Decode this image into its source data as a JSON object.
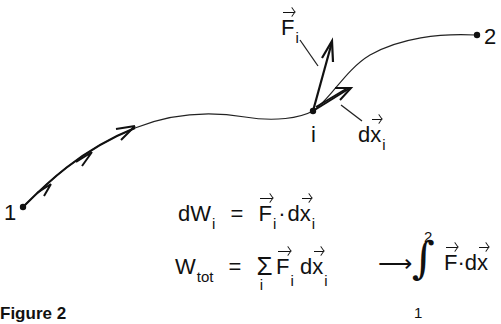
{
  "diagram": {
    "type": "work-along-path",
    "points": [
      {
        "id": "start",
        "label": "1",
        "x": 23,
        "y": 207
      },
      {
        "id": "intermediate",
        "label": "i",
        "x": 313,
        "y": 111
      },
      {
        "id": "end",
        "label": "2",
        "x": 476,
        "y": 35
      }
    ],
    "vectors": {
      "force": {
        "symbol": "F",
        "subscript": "i"
      },
      "displacement": {
        "symbol": "dx",
        "subscript": "i"
      }
    },
    "stroke_color": "#111111",
    "background_color": "#ffffff"
  },
  "labels": {
    "point_1": "1",
    "point_2": "2",
    "point_i": "i",
    "force": {
      "main": "F",
      "sub": "i"
    },
    "displacement": {
      "prefix": "d",
      "main": "x",
      "sub": "i"
    }
  },
  "equations": {
    "eq1": {
      "lhs_main": "dW",
      "lhs_sub": "i",
      "equals": "=",
      "rhs_f": "F",
      "rhs_f_sub": "i",
      "dot": "·",
      "rhs_d": "d",
      "rhs_x": "x",
      "rhs_x_sub": "i"
    },
    "eq2": {
      "lhs_main": "W",
      "lhs_sub": "tot",
      "equals": "=",
      "sum": "Σ",
      "sum_sub": "i",
      "f": "F",
      "f_sub": "i",
      "d": "d",
      "x": "x",
      "x_sub": "i",
      "arrow": "⟶",
      "integral": "∫",
      "upper_limit": "2",
      "lower_limit": "1",
      "int_f": "F",
      "int_dot": "·",
      "int_d": "d",
      "int_x": "x"
    }
  },
  "caption": "Figure 2"
}
